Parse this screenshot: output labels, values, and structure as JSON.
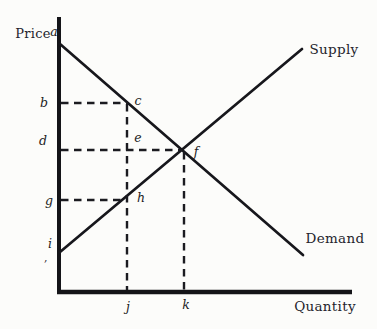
{
  "figure": {
    "kind": "supply-demand-diagram",
    "axes": {
      "y_label": "Price",
      "x_label": "Quantity"
    },
    "curves": {
      "supply_label": "Supply",
      "demand_label": "Demand"
    },
    "point_labels": {
      "a": "a",
      "b": "b",
      "c": "c",
      "d": "d",
      "e": "e",
      "f": "f",
      "g": "g",
      "h": "h",
      "i": "i",
      "j": "j",
      "k": "k"
    },
    "stray_mark": ",",
    "colors": {
      "ink": "#17171c",
      "background": "#fcfcfa"
    }
  }
}
